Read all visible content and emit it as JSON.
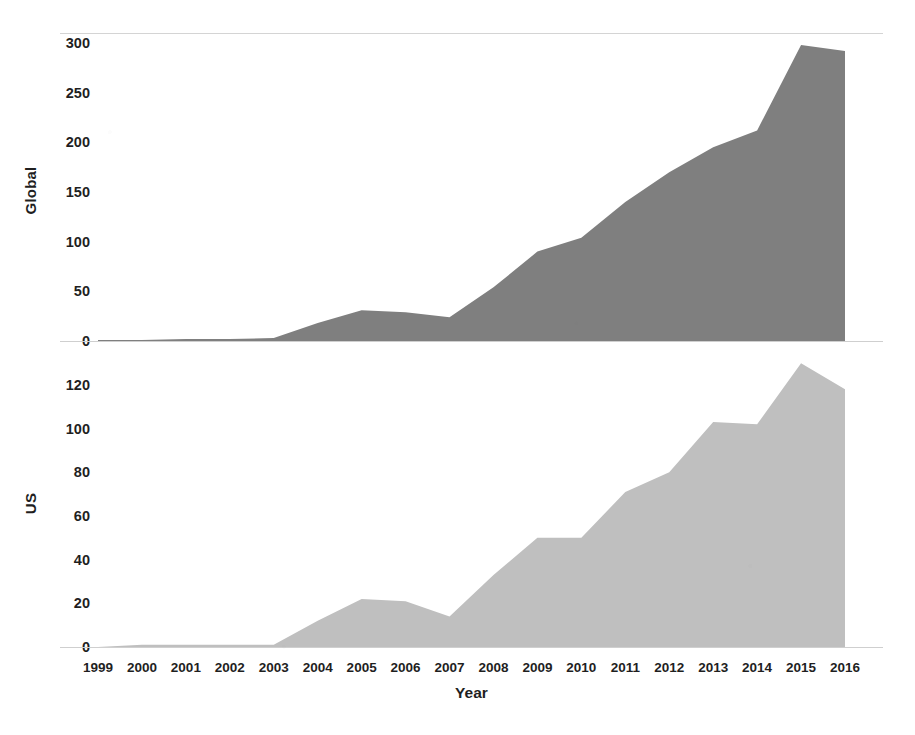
{
  "chart_data": {
    "type": "area",
    "title": "",
    "subtitle": "",
    "xlabel": "Year",
    "grid": true,
    "legend": false,
    "categories": [
      "1999",
      "2000",
      "2001",
      "2002",
      "2003",
      "2004",
      "2005",
      "2006",
      "2007",
      "2008",
      "2009",
      "2010",
      "2011",
      "2012",
      "2013",
      "2014",
      "2015",
      "2016"
    ],
    "panels": [
      {
        "name": "global-panel",
        "ylabel": "Global",
        "ylim": [
          0,
          300
        ],
        "yticks": [
          0,
          50,
          100,
          150,
          200,
          250,
          300
        ],
        "ytick_labels": [
          "0",
          "50",
          "100",
          "150",
          "200",
          "250",
          "300"
        ],
        "series_name": "Global",
        "color": "#7f7f7f",
        "values": [
          1,
          1,
          2,
          2,
          3,
          18,
          31,
          29,
          24,
          54,
          90,
          104,
          140,
          170,
          195,
          212,
          298,
          292
        ]
      },
      {
        "name": "us-panel",
        "ylabel": "US",
        "ylim": [
          0,
          130
        ],
        "yticks": [
          0,
          20,
          40,
          60,
          80,
          100,
          120
        ],
        "ytick_labels": [
          "0",
          "20",
          "40",
          "60",
          "80",
          "100",
          "120"
        ],
        "series_name": "US",
        "color": "#bfbfbf",
        "values": [
          0,
          1,
          1,
          1,
          1,
          12,
          22,
          21,
          14,
          33,
          50,
          50,
          71,
          80,
          103,
          102,
          130,
          118
        ]
      }
    ]
  },
  "layout": {
    "plot_left": 98,
    "plot_right": 845
  }
}
